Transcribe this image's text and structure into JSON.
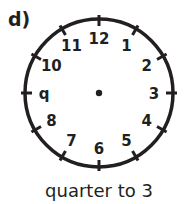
{
  "question_label": "d)",
  "clock": {
    "numerals": [
      "12",
      "1",
      "2",
      "3",
      "4",
      "5",
      "6",
      "7",
      "8",
      "q",
      "10",
      "11"
    ],
    "hands_drawn": false,
    "colors": {
      "stroke": "#231f20",
      "background": "#ffffff"
    }
  },
  "caption": "quarter to 3"
}
